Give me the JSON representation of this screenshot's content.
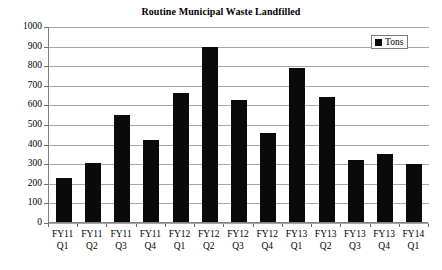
{
  "chart_data": {
    "type": "bar",
    "title": "Routine Municipal Waste Landfilled",
    "xlabel": "",
    "ylabel": "",
    "ylim": [
      0,
      1000
    ],
    "ytick_step": 100,
    "ytick_labels": [
      "0",
      "100",
      "200",
      "300",
      "400",
      "500",
      "600",
      "700",
      "800",
      "900",
      "1000"
    ],
    "grid": true,
    "legend_position": "top-right",
    "categories": [
      "FY11 Q1",
      "FY11 Q2",
      "FY11 Q3",
      "FY11 Q4",
      "FY12 Q1",
      "FY12 Q2",
      "FY12 Q3",
      "FY12 Q4",
      "FY13 Q1",
      "FY13 Q2",
      "FY13 Q3",
      "FY13 Q4",
      "FY14 Q1"
    ],
    "category_lines": [
      [
        "FY11",
        "Q1"
      ],
      [
        "FY11",
        "Q2"
      ],
      [
        "FY11",
        "Q3"
      ],
      [
        "FY11",
        "Q4"
      ],
      [
        "FY12",
        "Q1"
      ],
      [
        "FY12",
        "Q2"
      ],
      [
        "FY12",
        "Q3"
      ],
      [
        "FY12",
        "Q4"
      ],
      [
        "FY13",
        "Q1"
      ],
      [
        "FY13",
        "Q2"
      ],
      [
        "FY13",
        "Q3"
      ],
      [
        "FY13",
        "Q4"
      ],
      [
        "FY14",
        "Q1"
      ]
    ],
    "series": [
      {
        "name": "Tons",
        "color": "#0a0a0a",
        "values": [
          225,
          300,
          545,
          420,
          660,
          895,
          620,
          455,
          785,
          640,
          318,
          345,
          298
        ]
      }
    ]
  },
  "legend": {
    "entries": [
      {
        "label": "Tons",
        "color": "#0a0a0a"
      }
    ]
  },
  "colors": {
    "bar": "#0a0a0a",
    "gridline": "#a6a6a6",
    "axis": "#808080",
    "background": "#ffffff",
    "text": "#000000"
  }
}
